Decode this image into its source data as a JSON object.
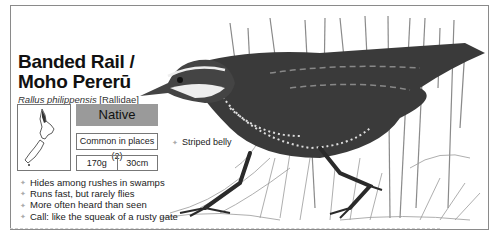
{
  "card": {
    "title_line1": "Banded Rail /",
    "title_line2": "Moho Pererū",
    "scientific_name": "Rallus philippensis",
    "family": "[Rallidae]",
    "status": "Native",
    "abundance": "Common in places (2)",
    "weight": "170g",
    "length": "30cm",
    "facts": [
      "Hides among rushes in swamps",
      "Runs fast, but rarely flies",
      "More often heard than seen",
      "Call: like the squeak of a rusty gate"
    ],
    "callouts": [
      {
        "label": "Striped belly"
      }
    ],
    "map_icon": "new-zealand-map-icon",
    "illustration": "banded-rail-bird-illustration",
    "colors": {
      "status_bg": "#9a9a9a",
      "border": "#777777",
      "text": "#111111"
    }
  }
}
